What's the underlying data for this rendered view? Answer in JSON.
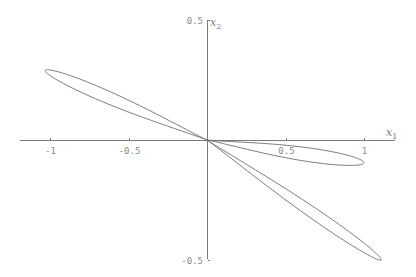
{
  "chart_data": {
    "type": "line",
    "title": "",
    "xlabel": "x1",
    "ylabel": "x2",
    "xlabel_main": "x",
    "xlabel_sub": "1",
    "ylabel_main": "x",
    "ylabel_sub": "2",
    "xlim": [
      -1.19,
      1.2
    ],
    "ylim": [
      -0.5,
      0.5
    ],
    "grid": false,
    "legend": null,
    "x_ticks": [
      {
        "value": -1,
        "label": "-1"
      },
      {
        "value": -0.5,
        "label": "-0.5"
      },
      {
        "value": 0.5,
        "label": "0.5"
      },
      {
        "value": 1,
        "label": "1"
      }
    ],
    "y_ticks": [
      {
        "value": 0.5,
        "label": "0.5"
      },
      {
        "value": -0.5,
        "label": "-0.5"
      }
    ],
    "series": [
      {
        "name": "loop-left",
        "description": "narrow closed loop from origin to tip near (-1.03, 0.29)",
        "tip": [
          -1.03,
          0.29
        ],
        "half_width": 0.045
      },
      {
        "name": "loop-right-small",
        "description": "closed loop from origin to tip near (1.0, -0.095)",
        "tip": [
          1.0,
          -0.095
        ],
        "half_width": 0.05
      },
      {
        "name": "loop-lower-right",
        "description": "narrow closed loop from origin to tip near (1.11, -0.50)",
        "tip": [
          1.11,
          -0.5
        ],
        "half_width": 0.04
      }
    ],
    "pixel_mapping": {
      "origin_px": [
        207,
        140
      ],
      "x_px_per_unit": 157,
      "y_px_per_unit": 240,
      "x_axis_px_range": [
        20,
        395
      ],
      "y_axis_px_range": [
        20,
        259
      ]
    },
    "colors": {
      "axis": "#7a7a7a",
      "curve": "#6e6e6e",
      "tick_label": "#8a8a8a",
      "background": "#ffffff"
    }
  }
}
